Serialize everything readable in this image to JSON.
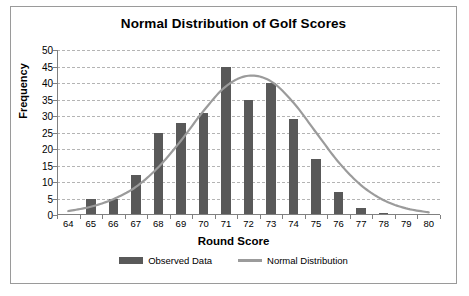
{
  "chart_data": {
    "type": "bar",
    "title": "Normal Distribution of Golf Scores",
    "xlabel": "Round Score",
    "ylabel": "Frequency",
    "categories": [
      "64",
      "65",
      "66",
      "67",
      "68",
      "69",
      "70",
      "71",
      "72",
      "73",
      "74",
      "75",
      "76",
      "77",
      "78",
      "79",
      "80"
    ],
    "values": [
      0,
      5,
      5,
      12,
      25,
      28,
      31,
      45,
      35,
      40,
      29,
      17,
      7,
      2,
      0.7,
      0,
      0
    ],
    "series": [
      {
        "name": "Observed Data",
        "type": "bar",
        "color": "#595959",
        "values": [
          0,
          5,
          5,
          12,
          25,
          28,
          31,
          45,
          35,
          40,
          29,
          17,
          7,
          2,
          0.7,
          0,
          0
        ]
      },
      {
        "name": "Normal Distribution",
        "type": "line",
        "color": "#9b9b9b",
        "values": [
          1.2,
          2.5,
          4.8,
          8.5,
          14.5,
          22.5,
          31.5,
          39.0,
          42.2,
          40.5,
          34.0,
          25.0,
          16.0,
          9.0,
          4.5,
          2.0,
          0.8
        ]
      }
    ],
    "ylim": [
      0,
      50
    ],
    "ytick_interval": 5,
    "yticks": [
      "0",
      "5",
      "10",
      "15",
      "20",
      "25",
      "30",
      "35",
      "40",
      "45",
      "50"
    ],
    "grid": true,
    "grid_style": "dashed-horizontal",
    "legend_position": "bottom",
    "legend": [
      {
        "label": "Observed Data",
        "swatch": "bar",
        "color": "#595959"
      },
      {
        "label": "Normal Distribution",
        "swatch": "line",
        "color": "#9b9b9b"
      }
    ]
  },
  "colors": {
    "bar": "#595959",
    "curve": "#9b9b9b",
    "grid": "#b4b4b4",
    "axis": "#808080",
    "border": "#9a9a9a",
    "text": "#000000"
  }
}
